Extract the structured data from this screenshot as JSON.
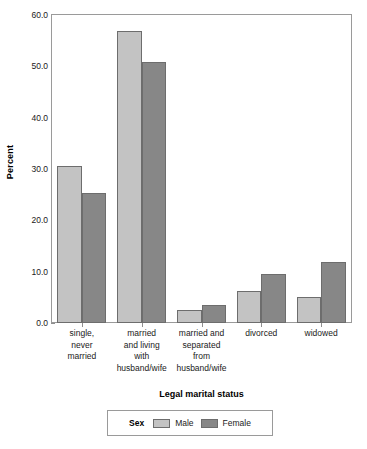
{
  "chart_data": {
    "type": "bar",
    "title": "",
    "xlabel": "Legal marital status",
    "ylabel": "Percent",
    "ylim": [
      0,
      60
    ],
    "ytick_step": 10,
    "ytick_labels": [
      "0.0",
      "10.0",
      "20.0",
      "30.0",
      "40.0",
      "50.0",
      "60.0"
    ],
    "ytick_values": [
      0,
      10,
      20,
      30,
      40,
      50,
      60
    ],
    "grid": false,
    "legend_position": "bottom",
    "legend_title": "Sex",
    "categories": [
      "single,\nnever\nmarried",
      "married\nand living\nwith\nhusband/wife",
      "married and\nseparated\nfrom\nhusband/wife",
      "divorced",
      "widowed"
    ],
    "category_lines": [
      [
        "single,",
        "never",
        "married"
      ],
      [
        "married",
        "and living",
        "with",
        "husband/wife"
      ],
      [
        "married and",
        "separated",
        "from",
        "husband/wife"
      ],
      [
        "divorced"
      ],
      [
        "widowed"
      ]
    ],
    "series": [
      {
        "name": "Male",
        "color": "#c3c3c3",
        "values": [
          30.6,
          56.8,
          2.5,
          6.3,
          5.0
        ]
      },
      {
        "name": "Female",
        "color": "#878787",
        "values": [
          25.4,
          50.9,
          3.6,
          9.6,
          11.8
        ]
      }
    ]
  },
  "colors": {
    "male": "#c3c3c3",
    "female": "#878787",
    "bar_border": "#6d6d6d",
    "frame": "#9a9a9a",
    "text": "#1a1a1a"
  }
}
